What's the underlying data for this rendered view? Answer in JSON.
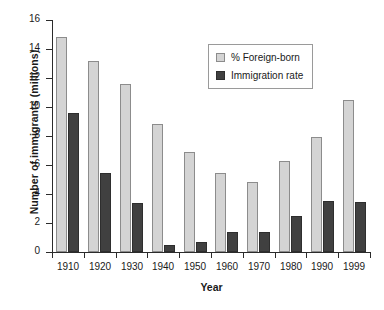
{
  "chart_data": {
    "type": "bar",
    "title": "",
    "xlabel": "Year",
    "ylabel": "Number of immigrants (millions)",
    "categories": [
      "1910",
      "1920",
      "1930",
      "1940",
      "1950",
      "1960",
      "1970",
      "1980",
      "1990",
      "1999"
    ],
    "series": [
      {
        "name": "% Foreign-born",
        "color": "#d4d4d4",
        "values": [
          14.8,
          13.2,
          11.6,
          8.8,
          6.9,
          5.45,
          4.85,
          6.25,
          7.95,
          10.5
        ]
      },
      {
        "name": "Immigration rate",
        "color": "#404040",
        "values": [
          9.6,
          5.45,
          3.35,
          0.45,
          0.7,
          1.4,
          1.4,
          2.45,
          3.5,
          3.45
        ]
      }
    ],
    "ylim": [
      0,
      16
    ],
    "yticks": [
      0,
      2,
      4,
      6,
      8,
      10,
      12,
      14,
      16
    ],
    "ytick_labels": [
      "0",
      "2",
      "4",
      "6",
      "8",
      "10",
      "12",
      "14",
      "16"
    ],
    "grid": false,
    "legend_position": "upper-right-inside"
  }
}
